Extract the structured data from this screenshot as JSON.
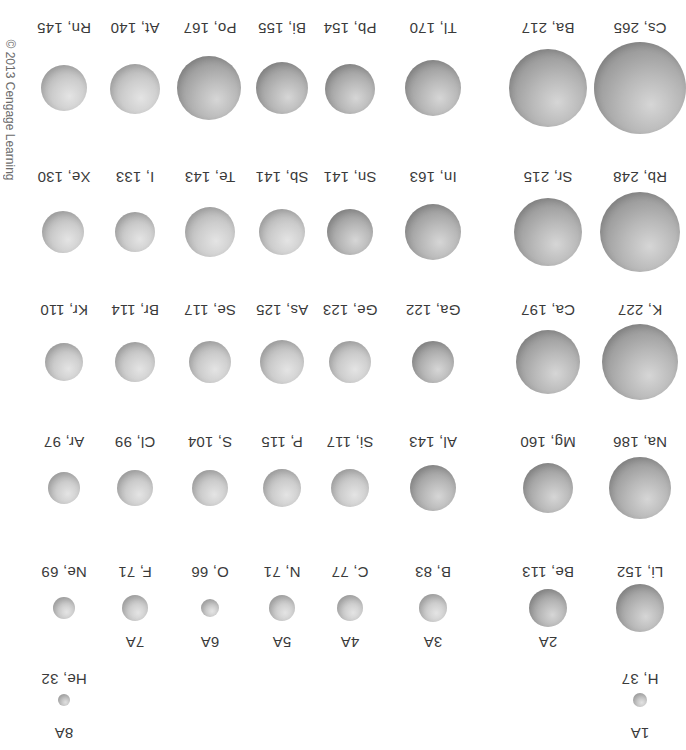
{
  "figure": {
    "orientation": "rotated 180 degrees",
    "copyright": "© 2013 Cengage Learning",
    "groups": [
      "1A",
      "2A",
      "3A",
      "4A",
      "5A",
      "6A",
      "7A",
      "8A"
    ],
    "elements": {
      "H": "H, 37",
      "He": "He, 32",
      "Li": "Li, 152",
      "Be": "Be, 113",
      "B": "B, 83",
      "C": "C, 77",
      "N": "N, 71",
      "O": "O, 66",
      "F": "F, 71",
      "Ne": "Ne, 69",
      "Na": "Na, 186",
      "Mg": "Mg, 160",
      "Al": "Al, 143",
      "Si": "Si, 117",
      "P": "P, 115",
      "S": "S, 104",
      "Cl": "Cl, 99",
      "Ar": "Ar, 97",
      "K": "K, 227",
      "Ca": "Ca, 197",
      "Ga": "Ga, 122",
      "Ge": "Ge, 123",
      "As": "As, 125",
      "Se": "Se, 117",
      "Br": "Br, 114",
      "Kr": "Kr, 110",
      "Rb": "Rb, 248",
      "Sr": "Sr, 215",
      "In": "In, 163",
      "Sn": "Sn, 141",
      "Sb": "Sb, 141",
      "Te": "Te, 143",
      "I": "I, 133",
      "Xe": "Xe, 130",
      "Cs": "Cs, 265",
      "Ba": "Ba, 217",
      "Tl": "Tl, 170",
      "Pb": "Pb, 154",
      "Bi": "Bi, 155",
      "Po": "Po, 167",
      "At": "At, 140",
      "Rn": "Rn, 145"
    },
    "colors": {
      "sphere_dark": "#8f8f8f",
      "sphere_light": "#d6d6d6",
      "text": "#3a3a3a",
      "background": "#ffffff"
    }
  }
}
